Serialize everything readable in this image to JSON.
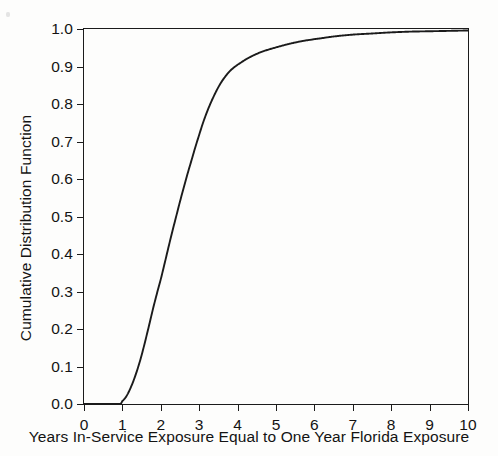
{
  "chart_data": {
    "type": "line",
    "title": "",
    "xlabel": "Years In-Service Exposure Equal to One Year Florida Exposure",
    "ylabel": "Cumulative Distribution Function",
    "xlim": [
      0,
      10
    ],
    "ylim": [
      0.0,
      1.0
    ],
    "grid": false,
    "legend": null,
    "xticks": [
      "0",
      "1",
      "2",
      "3",
      "4",
      "5",
      "6",
      "7",
      "8",
      "9",
      "10"
    ],
    "xtick_values": [
      0,
      1,
      2,
      3,
      4,
      5,
      6,
      7,
      8,
      9,
      10
    ],
    "yticks": [
      "0.0",
      "0.1",
      "0.2",
      "0.3",
      "0.4",
      "0.5",
      "0.6",
      "0.7",
      "0.8",
      "0.9",
      "1.0"
    ],
    "ytick_values": [
      0.0,
      0.1,
      0.2,
      0.3,
      0.4,
      0.5,
      0.6,
      0.7,
      0.8,
      0.9,
      1.0
    ],
    "series": [
      {
        "name": "Cumulative Distribution Function",
        "color": "#1b1b1b",
        "x": [
          0.0,
          0.5,
          0.8,
          0.95,
          1.0,
          1.1,
          1.2,
          1.3,
          1.4,
          1.5,
          1.6,
          1.7,
          1.8,
          1.9,
          2.0,
          2.1,
          2.2,
          2.3,
          2.4,
          2.5,
          2.6,
          2.7,
          2.8,
          2.9,
          3.0,
          3.1,
          3.2,
          3.3,
          3.4,
          3.5,
          3.6,
          3.7,
          3.8,
          3.9,
          4.0,
          4.2,
          4.4,
          4.6,
          4.8,
          5.0,
          5.25,
          5.5,
          5.75,
          6.0,
          6.5,
          7.0,
          7.5,
          8.0,
          8.5,
          9.0,
          9.5,
          10.0
        ],
        "y": [
          0.0,
          0.0,
          0.0,
          0.0,
          0.008,
          0.02,
          0.04,
          0.065,
          0.095,
          0.13,
          0.17,
          0.212,
          0.255,
          0.295,
          0.333,
          0.375,
          0.418,
          0.46,
          0.5,
          0.54,
          0.578,
          0.615,
          0.65,
          0.685,
          0.718,
          0.75,
          0.778,
          0.803,
          0.825,
          0.845,
          0.862,
          0.876,
          0.888,
          0.897,
          0.905,
          0.918,
          0.929,
          0.938,
          0.945,
          0.951,
          0.958,
          0.964,
          0.969,
          0.973,
          0.98,
          0.985,
          0.988,
          0.991,
          0.993,
          0.994,
          0.995,
          0.996
        ]
      }
    ]
  },
  "axes": {
    "y_title": "Cumulative Distribution Function",
    "x_title": "Years In-Service Exposure Equal to One Year Florida Exposure"
  }
}
